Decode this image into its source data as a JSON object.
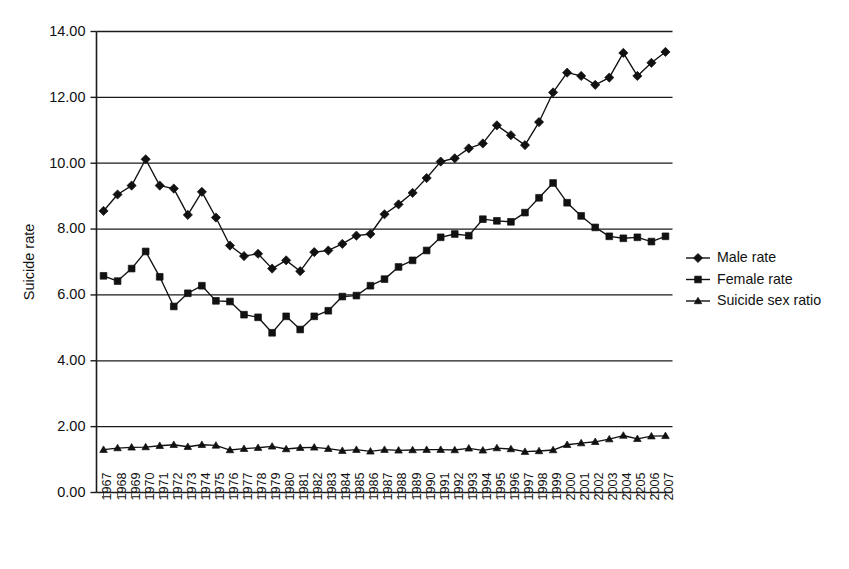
{
  "chart_data": {
    "type": "line",
    "title": "",
    "xlabel": "",
    "ylabel": "Suicide rate",
    "ylim": [
      0,
      14
    ],
    "ytick_step": 2,
    "ytick_labels": [
      "0.00",
      "2.00",
      "4.00",
      "6.00",
      "8.00",
      "10.00",
      "12.00",
      "14.00"
    ],
    "grid": "horizontal",
    "legend_position": "right",
    "categories": [
      "1967",
      "1968",
      "1969",
      "1970",
      "1971",
      "1972",
      "1973",
      "1974",
      "1975",
      "1976",
      "1977",
      "1978",
      "1979",
      "1980",
      "1981",
      "1982",
      "1983",
      "1984",
      "1985",
      "1986",
      "1987",
      "1988",
      "1989",
      "1990",
      "1991",
      "1992",
      "1993",
      "1994",
      "1995",
      "1996",
      "1997",
      "1998",
      "1999",
      "2000",
      "2001",
      "2002",
      "2003",
      "2004",
      "2205",
      "2006",
      "2007"
    ],
    "series": [
      {
        "name": "Male rate",
        "marker": "diamond",
        "values": [
          8.55,
          9.05,
          9.32,
          10.12,
          9.32,
          9.23,
          8.43,
          9.13,
          8.35,
          7.5,
          7.18,
          7.25,
          6.8,
          7.05,
          6.72,
          7.3,
          7.35,
          7.55,
          7.8,
          7.85,
          8.45,
          8.75,
          9.1,
          9.55,
          10.05,
          10.15,
          10.45,
          10.6,
          11.15,
          10.85,
          10.55,
          11.25,
          12.15,
          12.75,
          12.65,
          12.38,
          12.6,
          13.35,
          12.65,
          13.05,
          13.38
        ]
      },
      {
        "name": "Female rate",
        "marker": "square",
        "values": [
          6.58,
          6.42,
          6.8,
          7.32,
          6.55,
          5.65,
          6.05,
          6.28,
          5.82,
          5.8,
          5.4,
          5.32,
          4.85,
          5.35,
          4.95,
          5.35,
          5.52,
          5.95,
          5.98,
          6.28,
          6.48,
          6.85,
          7.05,
          7.35,
          7.75,
          7.85,
          7.8,
          8.3,
          8.25,
          8.22,
          8.5,
          8.95,
          9.4,
          8.8,
          8.4,
          8.05,
          7.78,
          7.72,
          7.75,
          7.62,
          7.78
        ]
      },
      {
        "name": "Suicide sex ratio",
        "marker": "triangle",
        "values": [
          1.3,
          1.35,
          1.37,
          1.38,
          1.42,
          1.45,
          1.39,
          1.45,
          1.43,
          1.29,
          1.33,
          1.36,
          1.4,
          1.32,
          1.36,
          1.37,
          1.33,
          1.27,
          1.3,
          1.25,
          1.3,
          1.28,
          1.29,
          1.3,
          1.3,
          1.29,
          1.34,
          1.28,
          1.35,
          1.32,
          1.24,
          1.26,
          1.29,
          1.45,
          1.5,
          1.54,
          1.62,
          1.73,
          1.63,
          1.71,
          1.72
        ]
      }
    ],
    "legend": [
      {
        "label": "Male rate",
        "marker": "diamond"
      },
      {
        "label": "Female rate",
        "marker": "square"
      },
      {
        "label": "Suicide sex ratio",
        "marker": "triangle"
      }
    ]
  }
}
